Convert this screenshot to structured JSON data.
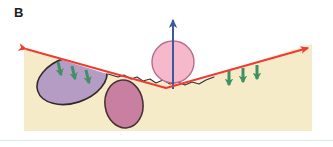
{
  "figure": {
    "panel_label": "B",
    "caption_text": "",
    "background_color": "#ffffff",
    "frame_rule_color": "#dce9f2",
    "width": 333,
    "height": 147
  },
  "terrain": {
    "name": "ground-surface",
    "fill_color": "#f6ebc8",
    "outline_color": "#3a3028",
    "description": "cream coloured subsurface block with a V-shaped depression in the middle",
    "surface_path": "M 24,47 L 62,60 L 104,73 L 128,78 L 140,81 L 150,80 L 158,83 L 166,81 L 176,84 L 190,83 L 200,81 L 214,76 L 248,64 L 286,52 L 312,44 L 312,131 L 24,131 Z"
  },
  "extension_arrow": {
    "name": "extension-stress-arrow",
    "color": "#ef3b33",
    "label": "",
    "direction": "double-headed",
    "path": "M 20,47 L 166,88 L 314,46",
    "head_left_at": [
      20,
      47
    ],
    "head_right_at": [
      314,
      46
    ],
    "stroke_width": 2
  },
  "uplift_arrow": {
    "name": "uplift-arrow",
    "color": "#3a5a9c",
    "label": "",
    "direction": "up",
    "x": 173,
    "tail_y": 89,
    "head_y": 14,
    "stroke_width": 2
  },
  "bodies": [
    {
      "name": "purple-body",
      "fill_color": "#b49cc4",
      "outline_color": "#332a2a",
      "shape": "ellipse",
      "cx": 72,
      "cy": 80,
      "rx": 36,
      "ry": 23,
      "rotation": -18
    },
    {
      "name": "magenta-body",
      "fill_color": "#c97fa0",
      "outline_color": "#4a3338",
      "shape": "ellipse",
      "cx": 124,
      "cy": 104,
      "rx": 19,
      "ry": 24,
      "rotation": -8
    },
    {
      "name": "pink-circle-body",
      "fill_color": "#f6b8cb",
      "outline_color": "#b86c8e",
      "shape": "circle",
      "cx": 173,
      "cy": 62,
      "r": 21,
      "rotation": 0
    }
  ],
  "subsidence_arrows": {
    "name": "subsidence-arrows",
    "color": "#3f9165",
    "left_group": [
      {
        "x1": 58,
        "y1": 62,
        "x2": 61,
        "y2": 79
      },
      {
        "x1": 72,
        "y1": 66,
        "x2": 75,
        "y2": 83
      },
      {
        "x1": 86,
        "y1": 70,
        "x2": 89,
        "y2": 87
      }
    ],
    "right_group": [
      {
        "x1": 229,
        "y1": 71,
        "x2": 229,
        "y2": 89
      },
      {
        "x1": 243,
        "y1": 68,
        "x2": 243,
        "y2": 86
      },
      {
        "x1": 257,
        "y1": 65,
        "x2": 257,
        "y2": 83
      }
    ],
    "stroke_width": 3
  }
}
